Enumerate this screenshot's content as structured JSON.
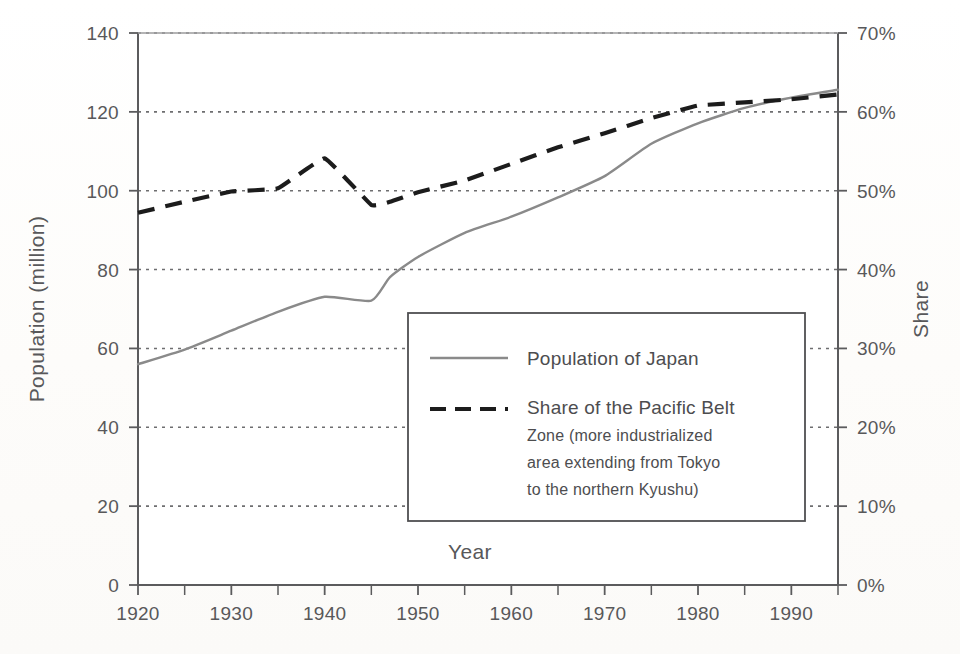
{
  "chart_data": {
    "type": "line",
    "title": "",
    "xlabel": "Year",
    "ylabel": "Population (million)",
    "y2label": "Share",
    "xlim": [
      1920,
      1995
    ],
    "ylim": [
      0,
      140
    ],
    "y2lim": [
      0,
      70
    ],
    "grid": true,
    "legend_position": "center-bottom-inside",
    "x_ticks": [
      1920,
      1930,
      1940,
      1950,
      1960,
      1970,
      1980,
      1990
    ],
    "x_tick_labels": [
      "1920",
      "1930",
      "1940",
      "1950",
      "1960",
      "1970",
      "1980",
      "1990"
    ],
    "x_minor_ticks": [
      1925,
      1935,
      1945,
      1955,
      1965,
      1975,
      1985,
      1995
    ],
    "y_ticks": [
      0,
      20,
      40,
      60,
      80,
      100,
      120,
      140
    ],
    "y_tick_labels": [
      "0",
      "20",
      "40",
      "60",
      "80",
      "100",
      "120",
      "140"
    ],
    "y2_ticks": [
      0,
      10,
      20,
      30,
      40,
      50,
      60,
      70
    ],
    "y2_tick_labels": [
      "0%",
      "10%",
      "20%",
      "30%",
      "40%",
      "50%",
      "60%",
      "70%"
    ],
    "series": [
      {
        "name": "Population of Japan",
        "axis": "left",
        "style": "solid",
        "color": "#8a8a8a",
        "width": 2.4,
        "x": [
          1920,
          1925,
          1930,
          1935,
          1940,
          1945,
          1947,
          1950,
          1955,
          1960,
          1965,
          1970,
          1975,
          1980,
          1985,
          1990,
          1995
        ],
        "values": [
          56.0,
          59.7,
          64.5,
          69.3,
          73.1,
          72.1,
          78.1,
          83.2,
          89.3,
          93.4,
          98.3,
          103.7,
          111.9,
          117.1,
          121.0,
          123.6,
          125.6
        ]
      },
      {
        "name": "Share of the Pacific Belt Zone (more industrialized area extending from Tokyo to the northern Kyushu)",
        "axis": "right",
        "style": "dashed",
        "color": "#1c1c1c",
        "width": 4.2,
        "x": [
          1920,
          1925,
          1930,
          1935,
          1940,
          1945,
          1947,
          1950,
          1955,
          1960,
          1965,
          1970,
          1975,
          1980,
          1985,
          1990,
          1995
        ],
        "values": [
          47.2,
          48.6,
          49.9,
          50.3,
          54.1,
          48.2,
          48.6,
          49.8,
          51.3,
          53.4,
          55.5,
          57.3,
          59.2,
          60.8,
          61.2,
          61.6,
          62.2
        ]
      }
    ]
  },
  "axes": {
    "left_title": "Population (million)",
    "right_title": "Share",
    "bottom_title": "Year"
  },
  "legend": {
    "entries": [
      {
        "sample": "solid-gray-line",
        "lines": [
          "Population of Japan"
        ]
      },
      {
        "sample": "dashed-black-line",
        "lines": [
          "Share of the Pacific Belt",
          "Zone (more industrialized",
          "area extending from Tokyo",
          "to the northern Kyushu)"
        ]
      }
    ]
  },
  "colors": {
    "population_line": "#8a8a8a",
    "share_line": "#1c1c1c",
    "axis": "#5b5b5d",
    "grid": "#6e6e70",
    "text": "#58585a",
    "background": "#fdfdfc"
  }
}
